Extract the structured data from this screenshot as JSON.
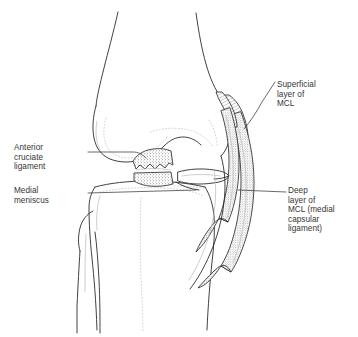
{
  "figure": {
    "kind": "anatomical-line-drawing",
    "canvas": {
      "width": 358,
      "height": 337,
      "background": "#ffffff"
    },
    "ink_color": "#2b2b2b",
    "text_color": "#353535"
  },
  "labels": {
    "anterior_cruciate_ligament": "Anterior\ncruciate\nligament",
    "medial_meniscus": "Medial\nmeniscus",
    "superficial_layer_mcl": "Superficial\nlayer of\nMCL",
    "deep_layer_mcl": "Deep\nlayer of\nMCL (medial\ncapsular\nligament)"
  },
  "structures": [
    {
      "name": "femur",
      "description": "femoral shaft widening into medial and lateral condyles"
    },
    {
      "name": "tibia",
      "description": "tibial plateau and shaft"
    },
    {
      "name": "fibula",
      "description": "fibular head and shaft, lateral and posterior to tibia"
    },
    {
      "name": "anterior-cruciate-ligament-stump",
      "description": "cut, stippled ligament stumps within the joint space"
    },
    {
      "name": "medial-meniscus",
      "description": "wedge of meniscus on the tibial plateau"
    },
    {
      "name": "superficial-mcl",
      "description": "long outer stippled band spanning femur to tibia"
    },
    {
      "name": "deep-mcl",
      "description": "short inner stippled band attaching to the meniscus"
    }
  ]
}
